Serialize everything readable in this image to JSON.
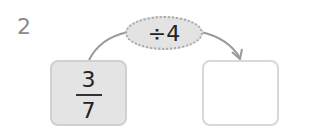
{
  "problem": {
    "number": "2",
    "operation": "÷4",
    "input": {
      "numerator": "3",
      "denominator": "7"
    },
    "output": ""
  }
}
